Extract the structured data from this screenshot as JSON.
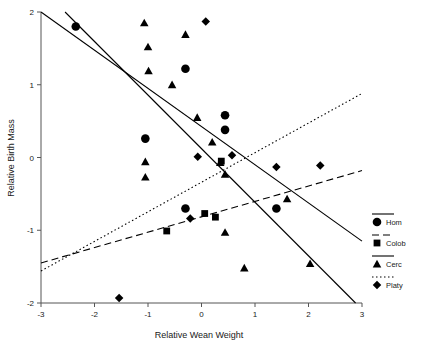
{
  "chart_data": {
    "type": "scatter",
    "title": "",
    "xlabel": "Relative Wean Weight",
    "ylabel": "Relative Birth Mass",
    "xlim": [
      -3,
      3
    ],
    "ylim": [
      -2,
      2
    ],
    "xticks": [
      "-3",
      "-2",
      "-1",
      "0",
      "1",
      "2",
      "3"
    ],
    "yticks": [
      "2",
      "1",
      "0",
      "-1",
      "-2"
    ],
    "xtick_values": [
      -3,
      -2,
      -1,
      0,
      1,
      2,
      3
    ],
    "ytick_values": [
      2,
      1,
      0,
      -1,
      -2
    ],
    "grid": false,
    "legend_position": "right",
    "series": [
      {
        "name": "Hom",
        "marker": "circle",
        "line_style": "solid",
        "color": "#000000",
        "points": [
          {
            "x": -2.35,
            "y": 1.8
          },
          {
            "x": -0.3,
            "y": 1.22
          },
          {
            "x": -1.05,
            "y": 0.26
          },
          {
            "x": 0.44,
            "y": 0.58
          },
          {
            "x": 0.44,
            "y": 0.38
          },
          {
            "x": -0.3,
            "y": -0.7
          },
          {
            "x": 1.4,
            "y": -0.7
          }
        ],
        "fit_line": {
          "x0": -3,
          "y0": 2.0,
          "x1": 3,
          "y1": -1.15
        }
      },
      {
        "name": "Colob",
        "marker": "square",
        "line_style": "dashed",
        "color": "#000000",
        "points": [
          {
            "x": -0.65,
            "y": -1.01
          },
          {
            "x": 0.06,
            "y": -0.77
          },
          {
            "x": 0.26,
            "y": -0.82
          },
          {
            "x": 0.37,
            "y": -0.05
          }
        ],
        "fit_line": {
          "x0": -3,
          "y0": -1.45,
          "x1": 3,
          "y1": -0.18
        }
      },
      {
        "name": "Cerc",
        "marker": "triangle",
        "line_style": "solid",
        "color": "#000000",
        "points": [
          {
            "x": -1.07,
            "y": 1.85
          },
          {
            "x": -1.0,
            "y": 1.52
          },
          {
            "x": -0.99,
            "y": 1.19
          },
          {
            "x": -0.55,
            "y": 1.0
          },
          {
            "x": -0.3,
            "y": 1.69
          },
          {
            "x": -0.08,
            "y": 0.55
          },
          {
            "x": 0.2,
            "y": 0.21
          },
          {
            "x": -1.05,
            "y": -0.06
          },
          {
            "x": -1.05,
            "y": -0.27
          },
          {
            "x": 0.35,
            "y": -0.07
          },
          {
            "x": 0.44,
            "y": -0.23
          },
          {
            "x": 0.44,
            "y": -1.03
          },
          {
            "x": 0.8,
            "y": -1.52
          },
          {
            "x": 1.6,
            "y": -0.57
          },
          {
            "x": 2.03,
            "y": -1.46
          }
        ],
        "fit_line": {
          "x0": -2.55,
          "y0": 2.0,
          "x1": 2.88,
          "y1": -2.0
        }
      },
      {
        "name": "Platy",
        "marker": "diamond",
        "line_style": "dotted",
        "color": "#000000",
        "points": [
          {
            "x": 0.08,
            "y": 1.87
          },
          {
            "x": -0.07,
            "y": 0.01
          },
          {
            "x": 0.57,
            "y": 0.03
          },
          {
            "x": -0.21,
            "y": -0.84
          },
          {
            "x": 1.4,
            "y": -0.13
          },
          {
            "x": 2.22,
            "y": -0.11
          },
          {
            "x": -1.54,
            "y": -1.93
          }
        ],
        "fit_line": {
          "x0": -3,
          "y0": -1.56,
          "x1": 3,
          "y1": 0.88
        }
      }
    ]
  },
  "legend": {
    "items": [
      {
        "label": "Hom",
        "marker": "circle",
        "line_style": "solid"
      },
      {
        "label": "Colob",
        "marker": "square",
        "line_style": "dashed"
      },
      {
        "label": "Cerc",
        "marker": "triangle",
        "line_style": "solid"
      },
      {
        "label": "Platy",
        "marker": "diamond",
        "line_style": "dotted"
      }
    ]
  }
}
